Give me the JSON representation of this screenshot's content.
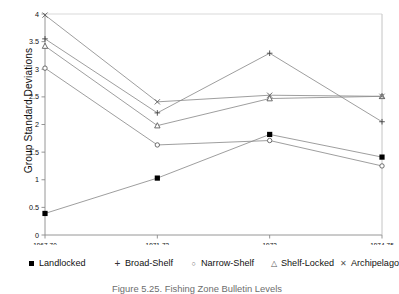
{
  "chart_data": {
    "type": "line",
    "title": "",
    "xlabel": "Conference Periods",
    "ylabel": "Group Standard Deviations",
    "categories": [
      "1967-70",
      "1971-73",
      "1973",
      "1974-75"
    ],
    "ylim": [
      0,
      4
    ],
    "yticks": [
      0,
      0.5,
      1,
      1.5,
      2,
      2.5,
      3,
      3.5,
      4
    ],
    "ytick_labels": [
      "0",
      "0.5",
      "1",
      "1.5",
      "2",
      "2.5",
      "3",
      "3.5",
      "4"
    ],
    "grid": false,
    "legend_position": "below-axis",
    "series": [
      {
        "name": "Landlocked",
        "marker": "filled-square",
        "values": [
          0.39,
          1.03,
          1.82,
          1.41
        ]
      },
      {
        "name": "Broad-Shelf",
        "marker": "plus",
        "values": [
          3.55,
          2.21,
          3.29,
          2.05
        ]
      },
      {
        "name": "Narrow-Shelf",
        "marker": "open-circle",
        "values": [
          3.02,
          1.63,
          1.71,
          1.25
        ]
      },
      {
        "name": "Shelf-Locked",
        "marker": "open-triangle",
        "values": [
          3.42,
          1.98,
          2.47,
          2.51
        ]
      },
      {
        "name": "Archipelago",
        "marker": "cross",
        "values": [
          3.98,
          2.41,
          2.53,
          2.51
        ]
      }
    ]
  },
  "axis": {
    "x_title": "Conference Periods",
    "y_title": "Group Standard Deviations"
  },
  "legend": {
    "items": [
      {
        "label": "Landlocked",
        "symbol": "filled-square"
      },
      {
        "label": "Broad-Shelf",
        "symbol": "plus"
      },
      {
        "label": "Narrow-Shelf",
        "symbol": "open-circle"
      },
      {
        "label": "Shelf-Locked",
        "symbol": "open-triangle"
      },
      {
        "label": "Archipelago",
        "symbol": "cross"
      }
    ]
  },
  "caption": {
    "text": "Figure 5.25.   Fishing Zone Bulletin Levels"
  }
}
